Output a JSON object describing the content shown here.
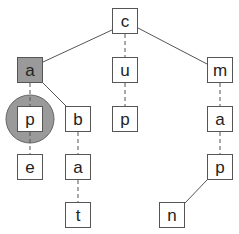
{
  "diagram": {
    "type": "trie",
    "highlight_node_color": "#9a9a9a",
    "highlight_circle_color": "#9a9a9a",
    "nodes": [
      {
        "id": "c",
        "label": "c",
        "x": 112,
        "y": 8
      },
      {
        "id": "a1",
        "label": "a",
        "x": 17,
        "y": 57,
        "highlight": true
      },
      {
        "id": "u",
        "label": "u",
        "x": 112,
        "y": 57
      },
      {
        "id": "m",
        "label": "m",
        "x": 207,
        "y": 57
      },
      {
        "id": "p1",
        "label": "p",
        "x": 17,
        "y": 106,
        "circled": true
      },
      {
        "id": "b",
        "label": "b",
        "x": 65,
        "y": 106
      },
      {
        "id": "p2",
        "label": "p",
        "x": 112,
        "y": 106
      },
      {
        "id": "a3",
        "label": "a",
        "x": 207,
        "y": 106
      },
      {
        "id": "e",
        "label": "e",
        "x": 17,
        "y": 154
      },
      {
        "id": "a2",
        "label": "a",
        "x": 65,
        "y": 154
      },
      {
        "id": "p3",
        "label": "p",
        "x": 207,
        "y": 154
      },
      {
        "id": "t",
        "label": "t",
        "x": 65,
        "y": 202
      },
      {
        "id": "n",
        "label": "n",
        "x": 159,
        "y": 202
      }
    ],
    "edges": [
      {
        "from": "c",
        "to": "a1",
        "style": "solid"
      },
      {
        "from": "c",
        "to": "u",
        "style": "dashed"
      },
      {
        "from": "c",
        "to": "m",
        "style": "solid"
      },
      {
        "from": "a1",
        "to": "p1",
        "style": "dashed"
      },
      {
        "from": "a1",
        "to": "b",
        "style": "solid"
      },
      {
        "from": "p1",
        "to": "e",
        "style": "dashed"
      },
      {
        "from": "b",
        "to": "a2",
        "style": "dashed"
      },
      {
        "from": "a2",
        "to": "t",
        "style": "dashed"
      },
      {
        "from": "u",
        "to": "p2",
        "style": "dashed"
      },
      {
        "from": "m",
        "to": "a3",
        "style": "dashed"
      },
      {
        "from": "a3",
        "to": "p3",
        "style": "dashed"
      },
      {
        "from": "p3",
        "to": "n",
        "style": "solid"
      }
    ]
  }
}
